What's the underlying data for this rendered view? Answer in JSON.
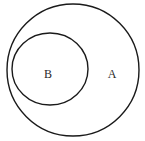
{
  "diagram": {
    "type": "venn-subset",
    "sets": [
      {
        "id": "A",
        "label": "A",
        "role": "outer"
      },
      {
        "id": "B",
        "label": "B",
        "role": "inner",
        "subset_of": "A"
      }
    ]
  }
}
